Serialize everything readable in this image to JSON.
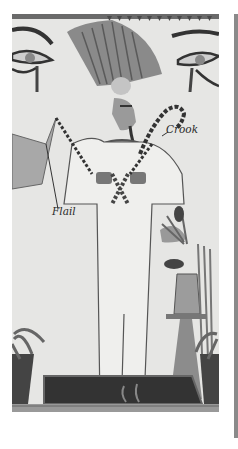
{
  "figure": {
    "labels": {
      "crook": "Crook",
      "flail": "Flail"
    },
    "colors": {
      "background": "#e6e6e4",
      "dark": "#3a3a3a",
      "mid": "#8c8c8c",
      "light": "#bdbdbd",
      "side_bar": "#8a8a8a"
    }
  }
}
